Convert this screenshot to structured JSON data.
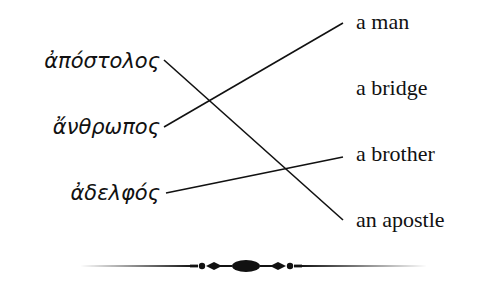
{
  "diagram": {
    "type": "matching-exercise",
    "left_terms": [
      {
        "text": "ἀπόστολος",
        "y": 61
      },
      {
        "text": "ἄνθρωπος",
        "y": 127
      },
      {
        "text": "ἀδελφός",
        "y": 193
      }
    ],
    "right_terms": [
      {
        "text": "a man",
        "y": 23
      },
      {
        "text": "a bridge",
        "y": 89
      },
      {
        "text": "a brother",
        "y": 155
      },
      {
        "text": "an apostle",
        "y": 221
      }
    ],
    "connections": [
      {
        "from": "ἀπόστολος",
        "to": "an apostle"
      },
      {
        "from": "ἄνθρωπος",
        "to": "a man"
      },
      {
        "from": "ἀδελφός",
        "to": "a brother"
      }
    ],
    "line_color": "#111111"
  }
}
